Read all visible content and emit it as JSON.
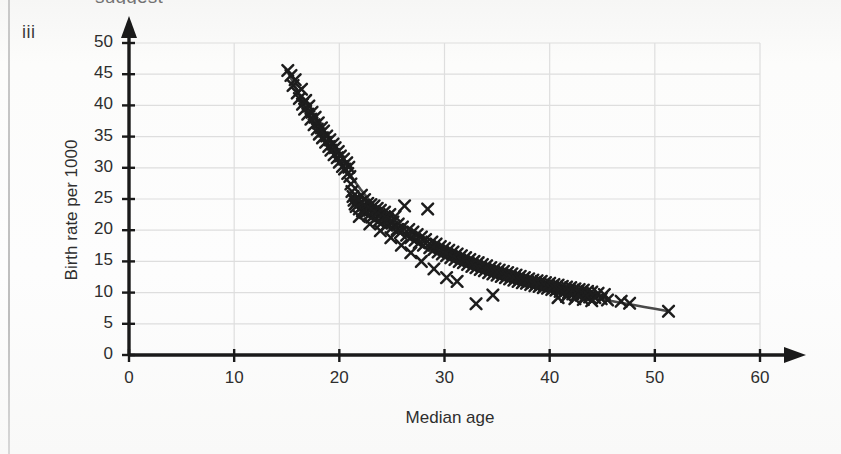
{
  "figure": {
    "label": "iii",
    "top_cut_text": "suggest",
    "bleed_text": ""
  },
  "colors": {
    "marker": "#1d1d1d",
    "curve": "#4a4a4a",
    "axis": "#1a1a1a",
    "grid": "#dedede",
    "text": "#2e2e2e",
    "background": "#fbfbfa"
  },
  "chart_data": {
    "type": "scatter",
    "title": "",
    "xlabel": "Median age",
    "ylabel": "Birth rate per 1000",
    "xlim": [
      0,
      60
    ],
    "ylim": [
      0,
      50
    ],
    "xticks": [
      0,
      10,
      20,
      30,
      40,
      50,
      60
    ],
    "yticks": [
      0,
      5,
      10,
      15,
      20,
      25,
      30,
      35,
      40,
      45,
      50
    ],
    "grid": true,
    "legend": null,
    "marker": "x",
    "series": [
      {
        "name": "Countries",
        "points": [
          [
            15.1,
            45.6
          ],
          [
            15.4,
            44.8
          ],
          [
            15.6,
            43.2
          ],
          [
            15.8,
            44.1
          ],
          [
            16.0,
            42.0
          ],
          [
            16.2,
            41.1
          ],
          [
            16.4,
            42.6
          ],
          [
            16.5,
            40.2
          ],
          [
            16.7,
            39.4
          ],
          [
            16.8,
            40.8
          ],
          [
            17.0,
            38.6
          ],
          [
            17.1,
            39.9
          ],
          [
            17.3,
            37.8
          ],
          [
            17.4,
            38.9
          ],
          [
            17.6,
            36.9
          ],
          [
            17.7,
            38.1
          ],
          [
            17.9,
            36.2
          ],
          [
            18.0,
            37.2
          ],
          [
            18.1,
            35.4
          ],
          [
            18.3,
            36.4
          ],
          [
            18.4,
            34.8
          ],
          [
            18.5,
            35.9
          ],
          [
            18.7,
            34.1
          ],
          [
            18.8,
            35.1
          ],
          [
            19.0,
            33.4
          ],
          [
            19.1,
            34.5
          ],
          [
            19.2,
            32.8
          ],
          [
            19.4,
            33.8
          ],
          [
            19.5,
            32.1
          ],
          [
            19.6,
            33.2
          ],
          [
            19.8,
            31.6
          ],
          [
            19.9,
            32.6
          ],
          [
            20.0,
            30.9
          ],
          [
            20.1,
            31.9
          ],
          [
            20.3,
            30.2
          ],
          [
            20.4,
            31.4
          ],
          [
            20.5,
            29.8
          ],
          [
            20.7,
            30.8
          ],
          [
            20.8,
            29.1
          ],
          [
            20.9,
            30.1
          ],
          [
            21.0,
            28.6
          ],
          [
            21.1,
            27.4
          ],
          [
            21.2,
            26.2
          ],
          [
            21.3,
            25.4
          ],
          [
            21.4,
            24.8
          ],
          [
            21.5,
            24.2
          ],
          [
            21.6,
            23.8
          ],
          [
            21.7,
            24.6
          ],
          [
            21.8,
            25.1
          ],
          [
            21.9,
            23.4
          ],
          [
            22.0,
            24.4
          ],
          [
            22.1,
            25.6
          ],
          [
            22.2,
            23.1
          ],
          [
            22.3,
            24.0
          ],
          [
            22.4,
            24.9
          ],
          [
            22.5,
            22.8
          ],
          [
            22.6,
            23.6
          ],
          [
            22.7,
            24.3
          ],
          [
            22.8,
            22.4
          ],
          [
            22.9,
            23.2
          ],
          [
            23.0,
            24.1
          ],
          [
            23.1,
            22.1
          ],
          [
            23.2,
            23.0
          ],
          [
            23.3,
            23.9
          ],
          [
            23.4,
            21.8
          ],
          [
            23.5,
            22.7
          ],
          [
            23.6,
            23.5
          ],
          [
            23.7,
            21.4
          ],
          [
            23.8,
            22.3
          ],
          [
            23.9,
            23.2
          ],
          [
            24.0,
            21.1
          ],
          [
            24.2,
            22.0
          ],
          [
            24.3,
            22.9
          ],
          [
            24.5,
            20.8
          ],
          [
            24.6,
            21.7
          ],
          [
            24.8,
            22.5
          ],
          [
            25.0,
            20.4
          ],
          [
            25.1,
            21.3
          ],
          [
            25.3,
            22.2
          ],
          [
            25.5,
            20.1
          ],
          [
            25.6,
            21.0
          ],
          [
            25.8,
            19.6
          ],
          [
            26.0,
            20.5
          ],
          [
            26.2,
            23.9
          ],
          [
            26.4,
            19.2
          ],
          [
            26.6,
            20.1
          ],
          [
            26.8,
            18.8
          ],
          [
            27.0,
            19.7
          ],
          [
            27.2,
            18.4
          ],
          [
            27.4,
            19.3
          ],
          [
            27.6,
            18.0
          ],
          [
            27.8,
            18.9
          ],
          [
            28.0,
            17.6
          ],
          [
            28.2,
            18.5
          ],
          [
            28.4,
            23.4
          ],
          [
            28.6,
            17.2
          ],
          [
            28.8,
            18.1
          ],
          [
            29.0,
            16.9
          ],
          [
            29.2,
            17.8
          ],
          [
            29.4,
            16.5
          ],
          [
            29.6,
            17.4
          ],
          [
            29.8,
            16.2
          ],
          [
            30.0,
            17.1
          ],
          [
            30.2,
            15.9
          ],
          [
            30.4,
            16.8
          ],
          [
            30.6,
            15.6
          ],
          [
            30.8,
            16.5
          ],
          [
            31.0,
            15.3
          ],
          [
            31.2,
            16.2
          ],
          [
            31.4,
            15.0
          ],
          [
            31.6,
            15.9
          ],
          [
            31.8,
            14.8
          ],
          [
            32.0,
            15.6
          ],
          [
            32.2,
            14.5
          ],
          [
            32.4,
            15.3
          ],
          [
            32.6,
            14.2
          ],
          [
            32.8,
            15.0
          ],
          [
            33.0,
            14.0
          ],
          [
            33.2,
            14.8
          ],
          [
            33.4,
            13.7
          ],
          [
            33.6,
            14.5
          ],
          [
            33.8,
            13.5
          ],
          [
            34.0,
            14.3
          ],
          [
            34.2,
            13.2
          ],
          [
            34.4,
            14.0
          ],
          [
            34.6,
            13.0
          ],
          [
            34.8,
            13.8
          ],
          [
            35.0,
            12.8
          ],
          [
            35.2,
            13.6
          ],
          [
            35.4,
            12.6
          ],
          [
            35.6,
            13.4
          ],
          [
            35.8,
            12.4
          ],
          [
            36.0,
            13.2
          ],
          [
            36.2,
            12.2
          ],
          [
            36.4,
            13.0
          ],
          [
            36.6,
            12.0
          ],
          [
            36.8,
            12.8
          ],
          [
            37.0,
            11.8
          ],
          [
            37.2,
            12.6
          ],
          [
            37.4,
            11.6
          ],
          [
            37.6,
            12.4
          ],
          [
            37.8,
            11.5
          ],
          [
            38.0,
            12.2
          ],
          [
            38.2,
            11.3
          ],
          [
            38.4,
            12.0
          ],
          [
            38.6,
            11.1
          ],
          [
            38.8,
            11.9
          ],
          [
            39.0,
            11.0
          ],
          [
            39.2,
            11.8
          ],
          [
            39.4,
            10.8
          ],
          [
            39.6,
            11.6
          ],
          [
            39.8,
            10.7
          ],
          [
            40.0,
            11.5
          ],
          [
            40.2,
            10.5
          ],
          [
            40.4,
            11.3
          ],
          [
            40.6,
            10.4
          ],
          [
            40.8,
            11.2
          ],
          [
            41.0,
            10.2
          ],
          [
            41.2,
            11.0
          ],
          [
            41.4,
            10.1
          ],
          [
            41.6,
            10.9
          ],
          [
            41.8,
            10.0
          ],
          [
            42.0,
            10.8
          ],
          [
            42.2,
            9.8
          ],
          [
            42.4,
            10.6
          ],
          [
            42.6,
            9.7
          ],
          [
            42.8,
            10.5
          ],
          [
            43.0,
            9.6
          ],
          [
            43.2,
            10.4
          ],
          [
            43.4,
            9.4
          ],
          [
            43.6,
            10.2
          ],
          [
            43.8,
            9.3
          ],
          [
            44.0,
            10.1
          ],
          [
            44.3,
            9.2
          ],
          [
            44.6,
            9.9
          ],
          [
            44.9,
            9.0
          ],
          [
            45.2,
            9.7
          ],
          [
            45.5,
            8.8
          ],
          [
            33.0,
            8.2
          ],
          [
            34.6,
            9.6
          ],
          [
            31.2,
            11.8
          ],
          [
            30.2,
            12.4
          ],
          [
            29.0,
            13.8
          ],
          [
            27.8,
            15.0
          ],
          [
            26.8,
            16.4
          ],
          [
            25.9,
            17.6
          ],
          [
            24.9,
            18.8
          ],
          [
            23.9,
            19.9
          ],
          [
            22.9,
            21.0
          ],
          [
            21.9,
            22.2
          ],
          [
            40.8,
            9.2
          ],
          [
            41.6,
            9.4
          ],
          [
            42.4,
            9.0
          ],
          [
            43.2,
            8.9
          ],
          [
            44.0,
            8.7
          ],
          [
            46.8,
            8.6
          ],
          [
            47.6,
            8.3
          ],
          [
            51.3,
            7.0
          ]
        ]
      }
    ],
    "fit_curve": {
      "name": "Fitted curve",
      "points": [
        [
          15.2,
          45.0
        ],
        [
          16.0,
          42.4
        ],
        [
          17.0,
          39.3
        ],
        [
          18.0,
          36.4
        ],
        [
          19.0,
          33.7
        ],
        [
          20.0,
          31.2
        ],
        [
          21.0,
          28.9
        ],
        [
          22.0,
          26.6
        ],
        [
          23.0,
          24.5
        ],
        [
          24.0,
          22.6
        ],
        [
          25.0,
          21.0
        ],
        [
          26.0,
          19.6
        ],
        [
          27.0,
          18.4
        ],
        [
          28.0,
          17.3
        ],
        [
          29.0,
          16.4
        ],
        [
          30.0,
          15.6
        ],
        [
          31.0,
          14.9
        ],
        [
          32.0,
          14.2
        ],
        [
          33.0,
          13.6
        ],
        [
          34.0,
          13.0
        ],
        [
          35.0,
          12.5
        ],
        [
          36.0,
          12.0
        ],
        [
          37.0,
          11.6
        ],
        [
          38.0,
          11.2
        ],
        [
          39.0,
          10.8
        ],
        [
          40.0,
          10.5
        ],
        [
          41.0,
          10.1
        ],
        [
          42.0,
          9.8
        ],
        [
          43.0,
          9.5
        ],
        [
          44.0,
          9.2
        ],
        [
          45.0,
          8.9
        ],
        [
          46.0,
          8.6
        ],
        [
          47.0,
          8.3
        ],
        [
          48.0,
          8.0
        ],
        [
          49.0,
          7.7
        ],
        [
          50.0,
          7.4
        ],
        [
          51.3,
          7.0
        ]
      ]
    }
  }
}
